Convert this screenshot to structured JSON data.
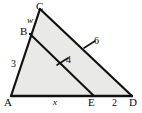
{
  "figure": {
    "type": "geometry-diagram",
    "fill_color": "#e9e9e7",
    "stroke_color": "#111111",
    "background_color": "#ffffff",
    "vertices": [
      {
        "name": "C",
        "label": "C",
        "x": 40,
        "y": 9
      },
      {
        "name": "B",
        "label": "B",
        "x": 30,
        "y": 34
      },
      {
        "name": "A",
        "label": "A",
        "x": 11,
        "y": 96
      },
      {
        "name": "E",
        "label": "E",
        "x": 94,
        "y": 96
      },
      {
        "name": "D",
        "label": "D",
        "x": 132,
        "y": 96
      }
    ],
    "segment_labels": [
      {
        "name": "label-w",
        "text": "w",
        "segment": "BC",
        "style": "italic"
      },
      {
        "name": "label-3",
        "text": "3",
        "segment": "AB",
        "style": "normal"
      },
      {
        "name": "label-x",
        "text": "x",
        "segment": "AE",
        "style": "italic"
      },
      {
        "name": "label-4",
        "text": "4",
        "segment": "BE",
        "style": "normal"
      },
      {
        "name": "label-6",
        "text": "6",
        "segment": "CD",
        "style": "normal"
      },
      {
        "name": "label-2",
        "text": "2",
        "segment": "ED",
        "style": "normal"
      }
    ],
    "tick_marks": [
      {
        "name": "tick-BE",
        "on_segment": "BE",
        "count": 1
      },
      {
        "name": "tick-CD",
        "on_segment": "CD",
        "count": 1
      }
    ]
  }
}
